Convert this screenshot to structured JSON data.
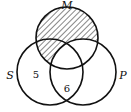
{
  "diagram": {
    "type": "venn-3",
    "sets": [
      {
        "id": "M",
        "label": "M"
      },
      {
        "id": "S",
        "label": "S"
      },
      {
        "id": "P",
        "label": "P"
      }
    ],
    "region_values": [
      {
        "region": "S only",
        "value": "5"
      },
      {
        "region": "S and P only",
        "value": "6"
      }
    ],
    "shaded_region": "M minus P",
    "colors": {
      "stroke": "#111111",
      "hatch": "#111111",
      "background": "#ffffff"
    }
  }
}
